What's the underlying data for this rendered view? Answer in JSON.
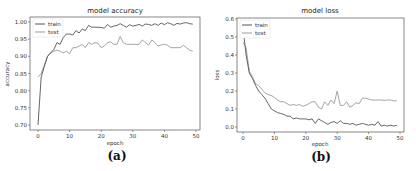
{
  "chart_data": [
    {
      "type": "line",
      "title": "model accuracy",
      "xlabel": "epoch",
      "ylabel": "accuracy",
      "caption": "(a)",
      "xlim": [
        0,
        50
      ],
      "ylim": [
        0.69,
        1.01
      ],
      "xticks": [
        0,
        10,
        20,
        30,
        40,
        50
      ],
      "yticks": [
        0.7,
        0.75,
        0.8,
        0.85,
        0.9,
        0.95,
        1.0
      ],
      "ytick_labels": [
        "0.70",
        "0.75",
        "0.80",
        "0.85",
        "0.90",
        "0.95",
        "1.00"
      ],
      "legend": {
        "position": "upper left",
        "entries": [
          "train",
          "test"
        ]
      },
      "grid": false,
      "x": [
        0,
        1,
        2,
        3,
        4,
        5,
        6,
        7,
        8,
        9,
        10,
        11,
        12,
        13,
        14,
        15,
        16,
        17,
        18,
        19,
        20,
        21,
        22,
        23,
        24,
        25,
        26,
        27,
        28,
        29,
        30,
        31,
        32,
        33,
        34,
        35,
        36,
        37,
        38,
        39,
        40,
        41,
        42,
        43,
        44,
        45,
        46,
        47,
        48,
        49
      ],
      "series": [
        {
          "name": "train",
          "color": "#555555",
          "values": [
            0.7,
            0.84,
            0.87,
            0.9,
            0.91,
            0.92,
            0.94,
            0.935,
            0.955,
            0.965,
            0.965,
            0.962,
            0.975,
            0.968,
            0.98,
            0.975,
            0.99,
            0.985,
            0.985,
            0.985,
            0.984,
            0.982,
            0.993,
            0.985,
            0.988,
            0.99,
            0.995,
            0.99,
            0.985,
            0.992,
            0.988,
            0.99,
            0.993,
            0.988,
            0.994,
            0.993,
            0.99,
            0.995,
            0.99,
            0.997,
            0.992,
            0.998,
            0.995,
            0.99,
            0.996,
            0.994,
            0.997,
            0.998,
            0.995,
            0.994
          ]
        },
        {
          "name": "test",
          "color": "#9a9a9a",
          "values": [
            0.84,
            0.85,
            0.875,
            0.9,
            0.91,
            0.915,
            0.918,
            0.915,
            0.91,
            0.915,
            0.908,
            0.925,
            0.925,
            0.93,
            0.935,
            0.925,
            0.94,
            0.935,
            0.94,
            0.938,
            0.925,
            0.93,
            0.94,
            0.942,
            0.935,
            0.935,
            0.958,
            0.94,
            0.935,
            0.935,
            0.935,
            0.935,
            0.935,
            0.948,
            0.94,
            0.933,
            0.948,
            0.94,
            0.93,
            0.933,
            0.935,
            0.932,
            0.925,
            0.925,
            0.925,
            0.925,
            0.932,
            0.925,
            0.918,
            0.915
          ]
        }
      ]
    },
    {
      "type": "line",
      "title": "model loss",
      "xlabel": "epoch",
      "ylabel": "loss",
      "caption": "(b)",
      "xlim": [
        0,
        50
      ],
      "ylim": [
        -0.02,
        0.6
      ],
      "xticks": [
        0,
        10,
        20,
        30,
        40,
        50
      ],
      "yticks": [
        0.0,
        0.1,
        0.2,
        0.3,
        0.4,
        0.5,
        0.6
      ],
      "ytick_labels": [
        "0.0",
        "0.1",
        "0.2",
        "0.3",
        "0.4",
        "0.5",
        "0.6"
      ],
      "legend": {
        "position": "upper left",
        "entries": [
          "train",
          "test"
        ]
      },
      "grid": false,
      "x": [
        0,
        1,
        2,
        3,
        4,
        5,
        6,
        7,
        8,
        9,
        10,
        11,
        12,
        13,
        14,
        15,
        16,
        17,
        18,
        19,
        20,
        21,
        22,
        23,
        24,
        25,
        26,
        27,
        28,
        29,
        30,
        31,
        32,
        33,
        34,
        35,
        36,
        37,
        38,
        39,
        40,
        41,
        42,
        43,
        44,
        45,
        46,
        47,
        48,
        49
      ],
      "series": [
        {
          "name": "train",
          "color": "#555555",
          "values": [
            0.55,
            0.4,
            0.3,
            0.27,
            0.23,
            0.2,
            0.18,
            0.16,
            0.13,
            0.1,
            0.09,
            0.08,
            0.075,
            0.07,
            0.06,
            0.06,
            0.045,
            0.05,
            0.045,
            0.045,
            0.045,
            0.04,
            0.045,
            0.02,
            0.045,
            0.035,
            0.025,
            0.015,
            0.025,
            0.03,
            0.02,
            0.035,
            0.02,
            0.02,
            0.015,
            0.02,
            0.01,
            0.015,
            0.02,
            0.015,
            0.01,
            0.015,
            0.01,
            0.03,
            0.005,
            0.01,
            0.005,
            0.01,
            0.005,
            0.01
          ]
        },
        {
          "name": "test",
          "color": "#9a9a9a",
          "values": [
            0.47,
            0.44,
            0.31,
            0.28,
            0.24,
            0.23,
            0.21,
            0.19,
            0.18,
            0.175,
            0.165,
            0.15,
            0.14,
            0.14,
            0.13,
            0.12,
            0.125,
            0.12,
            0.125,
            0.115,
            0.12,
            0.13,
            0.14,
            0.14,
            0.11,
            0.1,
            0.14,
            0.12,
            0.15,
            0.13,
            0.2,
            0.12,
            0.12,
            0.14,
            0.11,
            0.12,
            0.135,
            0.13,
            0.16,
            0.16,
            0.155,
            0.15,
            0.15,
            0.15,
            0.15,
            0.148,
            0.15,
            0.15,
            0.145,
            0.145
          ]
        }
      ]
    }
  ]
}
